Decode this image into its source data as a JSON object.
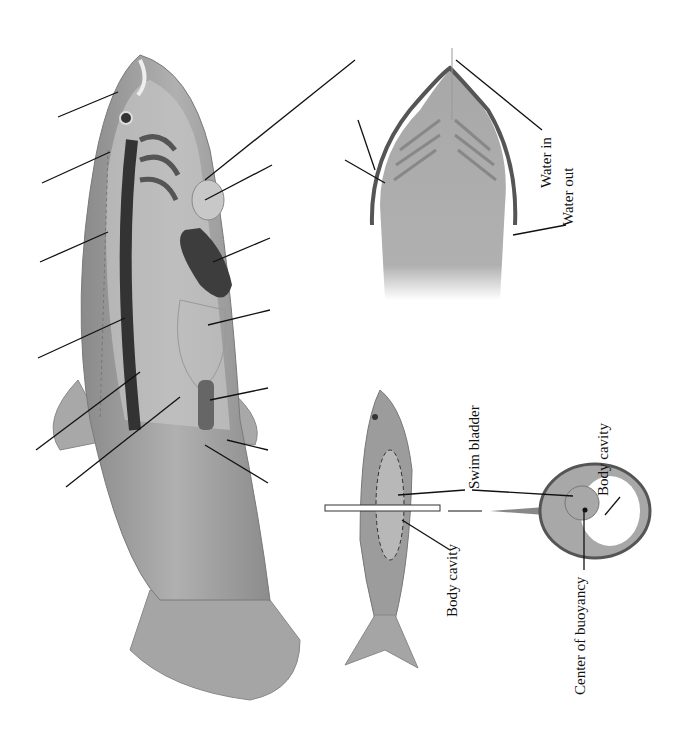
{
  "gill_diagram": {
    "labels": {
      "water_in": "Water in",
      "water_out": "Water out"
    }
  },
  "buoyancy_diagram": {
    "labels": {
      "swim_bladder": "Swim bladder",
      "body_cavity_fish": "Body cavity",
      "body_cavity_section": "Body cavity",
      "center_of_buoyancy": "Center of buoyancy"
    }
  },
  "anatomy_diagram": {
    "unlabeled_leader_lines": 13
  },
  "colors": {
    "body": "#9a9a9a",
    "body_light": "#b8b8b8",
    "organ_dark": "#3a3a3a",
    "outline": "#555555"
  }
}
